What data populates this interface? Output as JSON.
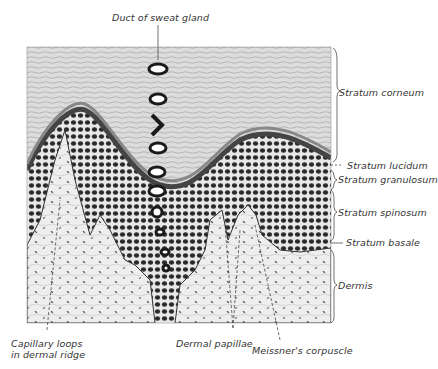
{
  "figure": {
    "type": "histology-diagram",
    "colors": {
      "background": "#ffffff",
      "ink": "#222222",
      "corneum": "#d9d9d9",
      "cell_layer": "#3a3a3a",
      "dermis": "#e6e6e6",
      "label_text": "#333333"
    }
  },
  "labels": {
    "top": {
      "duct": "Duct of sweat gland"
    },
    "right": {
      "corneum": "Stratum corneum",
      "lucidum": "Stratum lucidum",
      "granulosum": "Stratum granulosum",
      "spinosum": "Stratum spinosum",
      "basale": "Stratum basale",
      "dermis": "Dermis"
    },
    "bottom": {
      "capillary_line1": "Capillary loops",
      "capillary_line2": "in dermal ridge",
      "papillae": "Dermal papillae",
      "meissner": "Meissner's corpuscle"
    }
  }
}
